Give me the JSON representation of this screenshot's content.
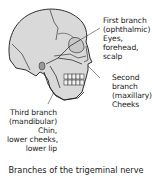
{
  "diagram": {
    "colors": {
      "bone": "#d9d9d9",
      "outline": "#1a1a1a",
      "background": "#ffffff"
    },
    "labels": {
      "first": {
        "lines": [
          "First branch",
          "(ophthalmic)",
          "Eyes,",
          "forehead,",
          "scalp"
        ]
      },
      "second": {
        "lines": [
          "Second",
          "branch",
          "(maxillary)",
          "Cheeks"
        ]
      },
      "third": {
        "lines": [
          "Third branch",
          "(mandibular)",
          "Chin,",
          "lower cheeks,",
          "lower lip"
        ]
      }
    },
    "caption": "Branches of the trigeminal nerve"
  }
}
